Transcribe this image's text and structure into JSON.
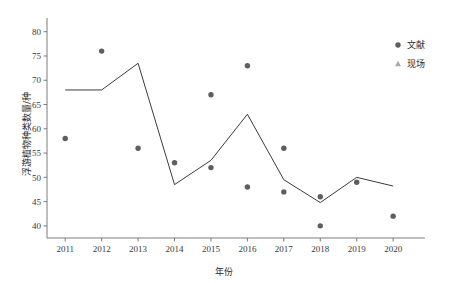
{
  "chart_data": {
    "type": "scatter",
    "title": "",
    "xlabel": "年份",
    "ylabel": "浮游植物种类数量/种",
    "x": [
      2011,
      2012,
      2013,
      2014,
      2015,
      2016,
      2017,
      2018,
      2019,
      2020
    ],
    "xtick_labels": [
      "2011",
      "2012",
      "2013",
      "2014",
      "2015",
      "2016",
      "2017",
      "2018",
      "2019",
      "2020"
    ],
    "ytick_labels": [
      "40",
      "45",
      "50",
      "55",
      "60",
      "65",
      "70",
      "75",
      "80"
    ],
    "ytick_values": [
      40,
      45,
      50,
      55,
      60,
      65,
      70,
      75,
      80
    ],
    "ylim": [
      37.5,
      82
    ],
    "xlim": [
      2010.5,
      2020.6
    ],
    "grid": false,
    "legend_position": "top-right",
    "series": [
      {
        "name": "文献",
        "marker": "circle",
        "color": "#5e5e5e",
        "points": [
          {
            "x": 2011,
            "y": 58
          },
          {
            "x": 2012,
            "y": 76
          },
          {
            "x": 2013,
            "y": 56
          },
          {
            "x": 2014,
            "y": 53
          },
          {
            "x": 2015,
            "y": 67
          },
          {
            "x": 2015,
            "y": 52
          },
          {
            "x": 2016,
            "y": 73
          },
          {
            "x": 2016,
            "y": 48
          },
          {
            "x": 2017,
            "y": 56
          },
          {
            "x": 2017,
            "y": 47
          },
          {
            "x": 2018,
            "y": 46
          },
          {
            "x": 2018,
            "y": 40
          },
          {
            "x": 2019,
            "y": 49
          },
          {
            "x": 2020,
            "y": 42
          }
        ]
      },
      {
        "name": "现场",
        "marker": "triangle",
        "color": "#a8a8a8",
        "points": [
          {
            "x": 2011,
            "y": 70
          },
          {
            "x": 2015,
            "y": 74
          },
          {
            "x": 2016,
            "y": 68
          },
          {
            "x": 2017,
            "y": 45.2
          },
          {
            "x": 2018,
            "y": 48.2
          },
          {
            "x": 2019,
            "y": 51.2
          },
          {
            "x": 2020,
            "y": 54.2
          }
        ]
      },
      {
        "name": "趋势线",
        "marker": "line",
        "color": "#3b3b3b",
        "values": [
          68,
          68,
          73.5,
          48.5,
          53.5,
          63,
          49.5,
          44.8,
          50,
          48.2
        ]
      }
    ],
    "legend": [
      {
        "label": "文献",
        "marker": "circle",
        "color": "#5e5e5e"
      },
      {
        "label": "现场",
        "marker": "triangle",
        "color": "#a8a8a8"
      }
    ]
  }
}
